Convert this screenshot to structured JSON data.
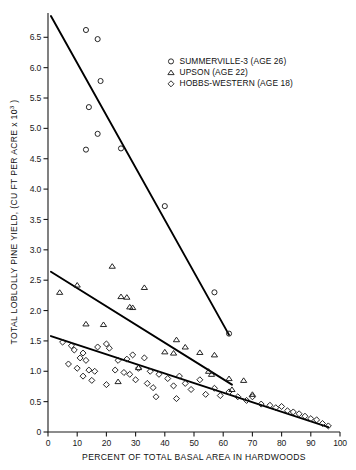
{
  "chart_data": {
    "type": "scatter",
    "title": "",
    "xlabel": "PERCENT OF TOTAL BASAL AREA IN HARDWOODS",
    "ylabel": "TOTAL LOBLOLLY PINE YIELD, (CU FT PER ACRE x 10",
    "ylabel_exponent": "3",
    "ylabel_tail": ")",
    "xlim": [
      0,
      100
    ],
    "ylim": [
      0,
      6.9
    ],
    "grid": false,
    "legend_position": "upper-right-inside",
    "xticks": [
      0,
      10,
      20,
      30,
      40,
      50,
      60,
      70,
      80,
      90,
      100
    ],
    "xticklabels": [
      "0",
      "10",
      "20",
      "30",
      "40",
      "50",
      "60",
      "70",
      "80",
      "90",
      "100"
    ],
    "yticks": [
      0,
      0.5,
      1.0,
      1.5,
      2.0,
      2.5,
      3.0,
      3.5,
      4.0,
      4.5,
      5.0,
      5.5,
      6.0,
      6.5
    ],
    "yticklabels": [
      "0",
      "0.5",
      "1.0",
      "1.5",
      "2.0",
      "2.5",
      "3.0",
      "3.5",
      "4.0",
      "4.5",
      "5.0",
      "5.5",
      "6.0",
      "6.5"
    ],
    "series": [
      {
        "name": "SUMMERVILLE-3 (AGE 26)",
        "marker": "circle",
        "legend_label": "SUMMERVILLE-3 (AGE 26)",
        "points": [
          [
            13.0,
            6.62
          ],
          [
            17.0,
            6.47
          ],
          [
            18.0,
            5.78
          ],
          [
            14.0,
            5.35
          ],
          [
            17.0,
            4.91
          ],
          [
            13.0,
            4.65
          ],
          [
            25.0,
            4.67
          ],
          [
            40.0,
            3.72
          ],
          [
            57.0,
            2.3
          ],
          [
            62.0,
            1.62
          ]
        ],
        "fit_line": {
          "x0": 1.0,
          "y0": 6.85,
          "x1": 62.0,
          "y1": 1.6
        }
      },
      {
        "name": "UPSON (AGE 22)",
        "marker": "triangle",
        "legend_label": "UPSON (AGE 22)",
        "points": [
          [
            4.0,
            2.3
          ],
          [
            10.0,
            2.42
          ],
          [
            22.0,
            2.73
          ],
          [
            25.0,
            2.23
          ],
          [
            27.0,
            2.22
          ],
          [
            33.0,
            2.38
          ],
          [
            28.0,
            2.06
          ],
          [
            29.0,
            2.05
          ],
          [
            13.0,
            1.78
          ],
          [
            19.0,
            1.77
          ],
          [
            44.0,
            1.52
          ],
          [
            47.0,
            1.4
          ],
          [
            40.0,
            1.32
          ],
          [
            43.0,
            1.3
          ],
          [
            52.0,
            1.31
          ],
          [
            57.0,
            1.27
          ],
          [
            31.0,
            1.06
          ],
          [
            55.0,
            1.0
          ],
          [
            56.0,
            0.95
          ],
          [
            62.0,
            0.88
          ],
          [
            67.0,
            0.85
          ],
          [
            24.0,
            0.83
          ],
          [
            63.0,
            0.7
          ],
          [
            70.0,
            0.62
          ]
        ],
        "fit_line": {
          "x0": 1.0,
          "y0": 2.64,
          "x1": 63.0,
          "y1": 0.78
        }
      },
      {
        "name": "HOBBS-WESTERN (AGE 18)",
        "marker": "diamond",
        "legend_label": "HOBBS-WESTERN (AGE 18)",
        "points": [
          [
            5.0,
            1.48
          ],
          [
            8.0,
            1.42
          ],
          [
            9.0,
            1.35
          ],
          [
            12.0,
            1.3
          ],
          [
            11.0,
            1.22
          ],
          [
            13.0,
            1.18
          ],
          [
            7.0,
            1.12
          ],
          [
            10.0,
            1.05
          ],
          [
            14.0,
            1.02
          ],
          [
            16.0,
            1.0
          ],
          [
            12.0,
            0.92
          ],
          [
            17.0,
            1.4
          ],
          [
            20.0,
            1.45
          ],
          [
            21.0,
            1.38
          ],
          [
            24.0,
            1.18
          ],
          [
            27.0,
            1.2
          ],
          [
            29.0,
            1.27
          ],
          [
            23.0,
            1.02
          ],
          [
            26.0,
            0.98
          ],
          [
            28.0,
            0.95
          ],
          [
            31.0,
            1.05
          ],
          [
            33.0,
            1.22
          ],
          [
            35.0,
            1.0
          ],
          [
            30.0,
            0.86
          ],
          [
            34.0,
            0.8
          ],
          [
            36.0,
            0.73
          ],
          [
            38.0,
            0.95
          ],
          [
            41.0,
            0.88
          ],
          [
            43.0,
            0.76
          ],
          [
            45.0,
            0.92
          ],
          [
            47.0,
            0.8
          ],
          [
            49.0,
            0.7
          ],
          [
            52.0,
            0.86
          ],
          [
            54.0,
            0.62
          ],
          [
            57.0,
            0.72
          ],
          [
            59.0,
            0.6
          ],
          [
            62.0,
            0.66
          ],
          [
            65.0,
            0.58
          ],
          [
            68.0,
            0.52
          ],
          [
            70.0,
            0.58
          ],
          [
            73.0,
            0.46
          ],
          [
            76.0,
            0.44
          ],
          [
            78.0,
            0.4
          ],
          [
            80.0,
            0.42
          ],
          [
            82.0,
            0.35
          ],
          [
            84.0,
            0.33
          ],
          [
            86.0,
            0.3
          ],
          [
            88.0,
            0.26
          ],
          [
            90.0,
            0.22
          ],
          [
            92.0,
            0.2
          ],
          [
            94.0,
            0.14
          ],
          [
            96.0,
            0.1
          ],
          [
            44.0,
            0.55
          ],
          [
            37.0,
            0.58
          ],
          [
            20.0,
            0.78
          ],
          [
            15.0,
            0.85
          ]
        ],
        "fit_line": {
          "x0": 1.0,
          "y0": 1.58,
          "x1": 96.0,
          "y1": 0.08
        }
      }
    ]
  }
}
